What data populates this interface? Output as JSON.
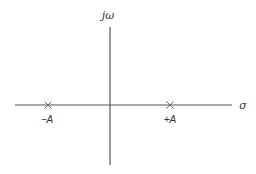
{
  "diagram": {
    "type": "s-plane pole-zero plot",
    "axes": {
      "vertical_label": "jω",
      "horizontal_label": "σ",
      "color": "#555555"
    },
    "markers": [
      {
        "symbol": "×",
        "label": "−A",
        "position": "left of origin"
      },
      {
        "symbol": "×",
        "label": "+A",
        "position": "right of origin"
      }
    ]
  }
}
